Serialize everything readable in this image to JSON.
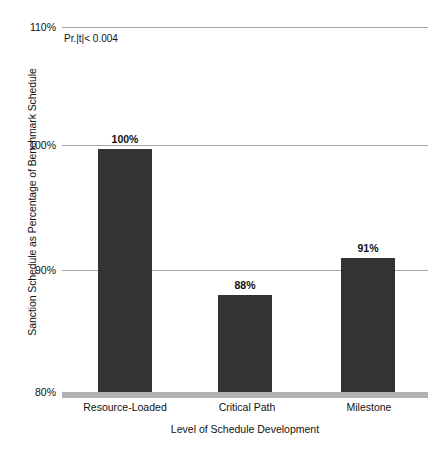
{
  "chart_data": {
    "type": "bar",
    "title": "",
    "categories": [
      "Resource-Loaded",
      "Critical Path",
      "Milestone"
    ],
    "values": [
      100,
      88,
      91
    ],
    "value_labels": [
      "100%",
      "88%",
      "91%"
    ],
    "xlabel": "Level of Schedule Development",
    "ylabel": "Sanction Schedule as Percentage of Benchmark Schedule",
    "ylim": [
      80,
      110
    ],
    "ytick_labels": [
      "110%",
      "100%",
      "90%",
      "80%"
    ],
    "ytick_values": [
      110,
      100,
      90,
      80
    ],
    "grid": true,
    "legend": "none",
    "annotations": [
      {
        "text": "Pr.|t|< 0.004"
      }
    ],
    "colors": {
      "bar": "#333333",
      "gridline": "#a6a6a6",
      "baseline": "#b2b2b2",
      "text": "#111111",
      "background": "#ffffff"
    }
  }
}
